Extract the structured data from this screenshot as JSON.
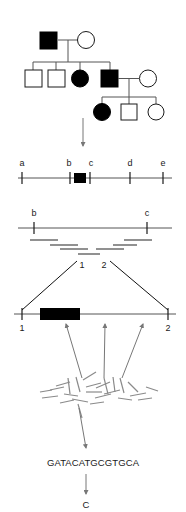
{
  "figure": {
    "background_color": "#ffffff",
    "ink_color": "#1a1a1a",
    "affected_fill": "#000000",
    "unaffected_fill": "#ffffff",
    "line_color": "#555555",
    "fragment_color": "#8a8a8a"
  },
  "pedigree": {
    "name": "family-pedigree",
    "generations": [
      {
        "id": "I",
        "members": [
          {
            "id": "I-1",
            "sex": "male",
            "shape": "square",
            "status": "affected",
            "filled": true
          },
          {
            "id": "I-2",
            "sex": "female",
            "shape": "circle",
            "status": "unaffected",
            "filled": false
          }
        ]
      },
      {
        "id": "II",
        "members": [
          {
            "id": "II-1",
            "sex": "male",
            "shape": "square",
            "status": "unaffected",
            "filled": false
          },
          {
            "id": "II-2",
            "sex": "male",
            "shape": "square",
            "status": "unaffected",
            "filled": false
          },
          {
            "id": "II-3",
            "sex": "female",
            "shape": "circle",
            "status": "affected",
            "filled": true
          },
          {
            "id": "II-4",
            "sex": "male",
            "shape": "square",
            "status": "affected",
            "filled": true
          },
          {
            "id": "II-5",
            "sex": "female",
            "shape": "circle",
            "status": "unaffected",
            "filled": false
          }
        ]
      },
      {
        "id": "III",
        "members": [
          {
            "id": "III-1",
            "sex": "female",
            "shape": "circle",
            "status": "affected",
            "filled": true
          },
          {
            "id": "III-2",
            "sex": "male",
            "shape": "square",
            "status": "unaffected",
            "filled": false
          },
          {
            "id": "III-3",
            "sex": "female",
            "shape": "circle",
            "status": "unaffected",
            "filled": false
          }
        ]
      }
    ]
  },
  "genetic_map": {
    "name": "genetic-linkage-map",
    "markers": [
      {
        "label": "a",
        "x": 22
      },
      {
        "label": "b",
        "x": 70
      },
      {
        "label": "c",
        "x": 90
      },
      {
        "label": "d",
        "x": 130
      },
      {
        "label": "e",
        "x": 163
      }
    ],
    "disease_locus": {
      "label": "",
      "x": 79,
      "width": 9,
      "filled": true
    }
  },
  "contig_map": {
    "name": "physical-contig-map",
    "flank_markers": [
      {
        "label": "b",
        "x": 34
      },
      {
        "label": "c",
        "x": 147
      }
    ],
    "clones": [
      {
        "x1": 30,
        "x2": 58,
        "y": 240
      },
      {
        "x1": 50,
        "x2": 78,
        "y": 245
      },
      {
        "x1": 124,
        "x2": 152,
        "y": 240
      },
      {
        "x1": 113,
        "x2": 137,
        "y": 245
      },
      {
        "x1": 60,
        "x2": 88,
        "y": 249
      },
      {
        "x1": 96,
        "x2": 124,
        "y": 249
      },
      {
        "x1": 78,
        "x2": 100,
        "y": 254
      }
    ],
    "minimal_tiling_labels": [
      {
        "label": "1",
        "x": 82
      },
      {
        "label": "2",
        "x": 104
      }
    ]
  },
  "expanded_segment": {
    "name": "expanded-clone-segment",
    "left_label": "1",
    "right_label": "2",
    "gene": {
      "label": "",
      "x1": 40,
      "x2": 80,
      "filled": true
    },
    "read_arrow_targets": [
      66,
      105,
      143
    ]
  },
  "shotgun": {
    "name": "shotgun-fragments",
    "description": "random sequence reads",
    "fragments": [
      {
        "x1": 50,
        "y1": 390,
        "x2": 64,
        "y2": 387
      },
      {
        "x1": 42,
        "y1": 398,
        "x2": 58,
        "y2": 396
      },
      {
        "x1": 68,
        "y1": 378,
        "x2": 70,
        "y2": 394
      },
      {
        "x1": 76,
        "y1": 377,
        "x2": 80,
        "y2": 392
      },
      {
        "x1": 83,
        "y1": 380,
        "x2": 96,
        "y2": 372
      },
      {
        "x1": 86,
        "y1": 387,
        "x2": 101,
        "y2": 383
      },
      {
        "x1": 86,
        "y1": 392,
        "x2": 102,
        "y2": 392
      },
      {
        "x1": 95,
        "y1": 398,
        "x2": 111,
        "y2": 394
      },
      {
        "x1": 104,
        "y1": 378,
        "x2": 108,
        "y2": 394
      },
      {
        "x1": 113,
        "y1": 377,
        "x2": 115,
        "y2": 392
      },
      {
        "x1": 120,
        "y1": 378,
        "x2": 124,
        "y2": 393
      },
      {
        "x1": 128,
        "y1": 382,
        "x2": 138,
        "y2": 392
      },
      {
        "x1": 130,
        "y1": 396,
        "x2": 146,
        "y2": 393
      },
      {
        "x1": 138,
        "y1": 400,
        "x2": 152,
        "y2": 398
      },
      {
        "x1": 60,
        "y1": 403,
        "x2": 74,
        "y2": 400
      },
      {
        "x1": 72,
        "y1": 399,
        "x2": 88,
        "y2": 402
      },
      {
        "x1": 90,
        "y1": 404,
        "x2": 104,
        "y2": 402
      },
      {
        "x1": 56,
        "y1": 386,
        "x2": 70,
        "y2": 382
      },
      {
        "x1": 96,
        "y1": 388,
        "x2": 110,
        "y2": 382
      },
      {
        "x1": 78,
        "y1": 404,
        "x2": 82,
        "y2": 418
      },
      {
        "x1": 118,
        "y1": 398,
        "x2": 132,
        "y2": 400
      },
      {
        "x1": 40,
        "y1": 392,
        "x2": 52,
        "y2": 390
      },
      {
        "x1": 146,
        "y1": 387,
        "x2": 158,
        "y2": 391
      },
      {
        "x1": 64,
        "y1": 394,
        "x2": 78,
        "y2": 396
      },
      {
        "x1": 104,
        "y1": 394,
        "x2": 120,
        "y2": 390
      }
    ]
  },
  "sequence": {
    "name": "dna-sequence",
    "bases": "GATACATGCGTGCA"
  },
  "variant": {
    "name": "variant-base",
    "base": "C"
  },
  "arrows": {
    "pedigree_to_map": "down-arrow",
    "shotgun_to_sequence": "down-arrow",
    "sequence_to_variant": "down-arrow"
  }
}
